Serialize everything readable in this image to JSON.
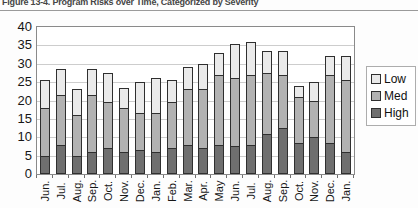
{
  "figure": {
    "title": "Figure 13-4. Program Risks over Time, Categorized by Severity"
  },
  "chart_data": {
    "type": "bar",
    "stacked": true,
    "title": "Figure 13-4. Program Risks over Time, Categorized by Severity",
    "xlabel": "",
    "ylabel": "",
    "categories": [
      "Jun.",
      "Jul.",
      "Aug.",
      "Sep.",
      "Oct.",
      "Nov.",
      "Dec.",
      "Jan.",
      "Feb.",
      "Mar.",
      "Apr.",
      "May",
      "Jun.",
      "Jul.",
      "Aug.",
      "Sep.",
      "Oct.",
      "Nov.",
      "Dec.",
      "Jan."
    ],
    "series": [
      {
        "name": "High",
        "color": "#6f6f6f",
        "values": [
          5,
          8,
          5,
          6,
          7,
          6,
          6.5,
          6,
          7,
          8,
          7,
          8,
          7.5,
          8,
          11,
          12.5,
          8.5,
          10,
          8.5,
          6
        ]
      },
      {
        "name": "Med",
        "color": "#b2b2b2",
        "values": [
          13,
          13.5,
          11,
          15.5,
          12.5,
          12,
          10,
          10.5,
          12.5,
          15,
          16,
          19,
          18.5,
          19,
          16.5,
          14.5,
          12.5,
          10,
          18.5,
          19.5
        ]
      },
      {
        "name": "Low",
        "color": "#eaeaea",
        "values": [
          7.5,
          7,
          7,
          7,
          8,
          5.5,
          8.5,
          9.5,
          6,
          6,
          7,
          6,
          9.5,
          9,
          6,
          6.5,
          3,
          5,
          5,
          6.5
        ]
      }
    ],
    "legend": [
      "Low",
      "Med",
      "High"
    ],
    "legend_position": "right",
    "ylim": [
      0,
      40
    ],
    "yticks": [
      0,
      5,
      10,
      15,
      20,
      25,
      30,
      35,
      40
    ],
    "grid": true,
    "palette": {
      "grid_color": "#cdcdcd",
      "plot_border": "#8a8a8a",
      "segment_border": "#2f2f2f",
      "text_color": "#161616",
      "title_color": "#454545"
    }
  }
}
